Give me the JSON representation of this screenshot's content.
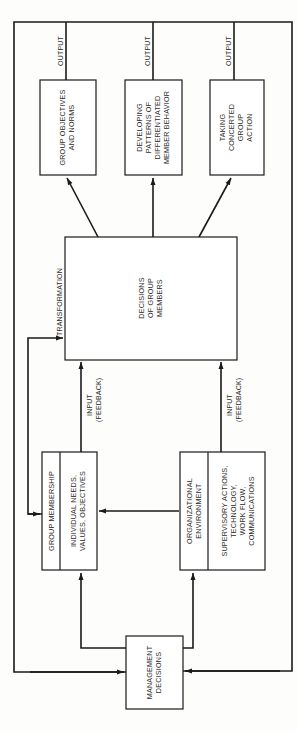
{
  "diagram": {
    "type": "flow-diagram",
    "orientation": "rotated-90-ccw",
    "colors": {
      "line": "#1a1a1a",
      "text": "#2a2a2a",
      "background": "#fdfdfc"
    },
    "output_boxes": [
      {
        "id": "group-objectives",
        "lines": [
          "GROUP OBJECTIVES",
          "AND NORMS"
        ]
      },
      {
        "id": "differentiated-behavior",
        "lines": [
          "DEVELOPING",
          "PATTERNS OF",
          "DIFFERENTIATED",
          "MEMBER BEHAVIOR"
        ]
      },
      {
        "id": "concerted-action",
        "lines": [
          "TAKING",
          "CONCERTED",
          "GROUP",
          "ACTION"
        ]
      }
    ],
    "output_label": "OUTPUT",
    "central_box": {
      "lines": [
        "DECISIONS",
        "OF GROUP",
        "MEMBERS"
      ]
    },
    "transformation_label": "TRANSFORMATION",
    "input_labels": {
      "line1": "INPUT",
      "line2": "(FEEDBACK)"
    },
    "group_membership_box": {
      "header": "GROUP MEMBERSHIP",
      "body": [
        "INDIVIDUAL NEEDS,",
        "VALUES, OBJECTIVES"
      ]
    },
    "organizational_environment_box": {
      "header": [
        "ORGANIZATIONAL",
        "ENVIRONMENT"
      ],
      "body": [
        "SUPERVISORY ACTIONS,",
        "TECHNOLOGY,",
        "WORK FLOW,",
        "COMMUNICATIONS"
      ]
    },
    "management_box": {
      "lines": [
        "MANAGEMENT",
        "DECISIONS"
      ]
    }
  }
}
